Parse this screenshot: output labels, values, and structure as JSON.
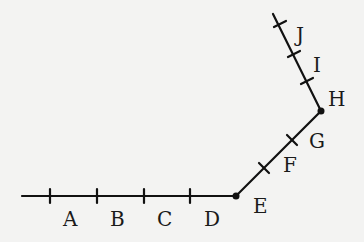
{
  "diagram": {
    "type": "bent-line-segments",
    "colors": {
      "background": "#f3f3f2",
      "stroke": "#111111"
    },
    "vertices": [
      {
        "name": "start",
        "x": 22,
        "y": 196
      },
      {
        "name": "bend1",
        "x": 236,
        "y": 196
      },
      {
        "name": "bend2",
        "x": 321,
        "y": 111
      },
      {
        "name": "end",
        "x": 273,
        "y": 14
      }
    ],
    "labels": [
      {
        "text": "A",
        "x": 63,
        "y": 226
      },
      {
        "text": "B",
        "x": 110,
        "y": 226
      },
      {
        "text": "C",
        "x": 157,
        "y": 226
      },
      {
        "text": "D",
        "x": 204,
        "y": 226
      },
      {
        "text": "E",
        "x": 257,
        "y": 213
      },
      {
        "text": "F",
        "x": 284,
        "y": 172
      },
      {
        "text": "G",
        "x": 313,
        "y": 148
      },
      {
        "text": "H",
        "x": 329,
        "y": 106
      },
      {
        "text": "I",
        "x": 312,
        "y": 72
      },
      {
        "text": "J",
        "x": 297,
        "y": 42
      }
    ]
  }
}
